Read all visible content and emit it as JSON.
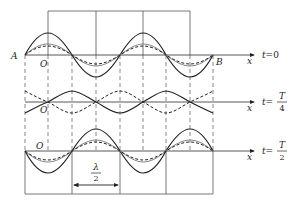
{
  "figure": {
    "labels": {
      "A": "A",
      "B": "B",
      "origin": "O",
      "x_axis": "x",
      "lambda_numer": "λ",
      "lambda_denom": "2"
    },
    "panels": [
      {
        "id": "t0",
        "time_prefix": "t=",
        "time_value": "0",
        "fraction": false
      },
      {
        "id": "tT4",
        "time_prefix": "t=",
        "time_numer": "T",
        "time_denom": "4",
        "fraction": true
      },
      {
        "id": "tT2",
        "time_prefix": "t=",
        "time_numer": "T",
        "time_denom": "2",
        "fraction": true
      }
    ],
    "colors": {
      "stroke": "#222222",
      "grid": "#555555",
      "faint": "#888888"
    }
  }
}
